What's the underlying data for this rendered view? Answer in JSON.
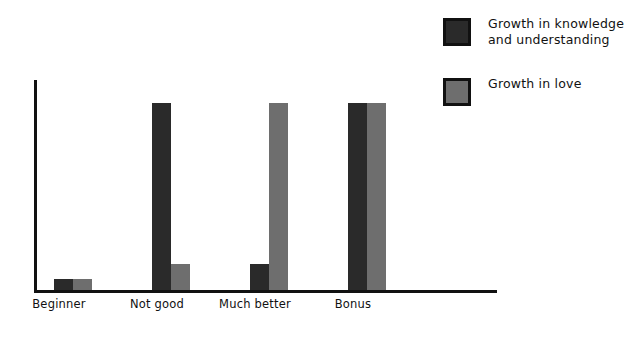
{
  "chart_data": {
    "type": "bar",
    "title": "",
    "subtitle": "",
    "xlabel": "",
    "ylabel": "",
    "grid": false,
    "legend_position": "top-right",
    "categories": [
      "Beginner",
      "Not good",
      "Much better",
      "Bonus"
    ],
    "ylim": [
      0,
      112
    ],
    "series": [
      {
        "name": "Growth in knowledge\nand understanding",
        "color": "#2a2a2a",
        "values": [
          6,
          100,
          14,
          100
        ]
      },
      {
        "name": "Growth in love",
        "color": "#6e6e6e",
        "values": [
          6,
          14,
          100,
          100
        ]
      }
    ],
    "axis_color": "#111111",
    "background": "#ffffff"
  },
  "legend": {
    "items": [
      {
        "label": "Growth in knowledge\nand understanding",
        "swatch": "#2a2a2a"
      },
      {
        "label": "Growth in love",
        "swatch": "#6e6e6e"
      }
    ]
  }
}
